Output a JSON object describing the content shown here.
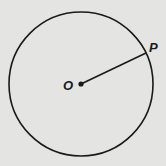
{
  "diagram": {
    "type": "circle-with-radius",
    "center_label": "O",
    "point_label": "P",
    "colors": {
      "background": "#e4e4e2",
      "stroke": "#1a1a1a"
    }
  }
}
